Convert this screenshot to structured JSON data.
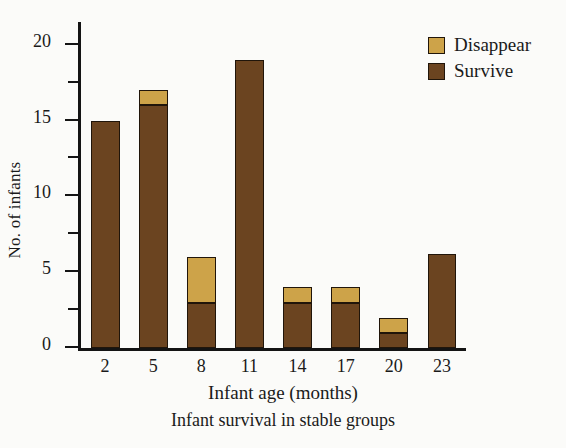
{
  "chart_data": {
    "type": "bar",
    "title": "",
    "caption": "Infant survival in stable groups",
    "xlabel": "Infant age (months)",
    "ylabel": "No. of infants",
    "categories": [
      "2",
      "5",
      "8",
      "11",
      "14",
      "17",
      "20",
      "23"
    ],
    "stacked": true,
    "series": [
      {
        "name": "Survive",
        "color": "#6b4420",
        "values": [
          15,
          16,
          3,
          19,
          3,
          3,
          1,
          6.2
        ]
      },
      {
        "name": "Disappear",
        "color": "#cda349",
        "values": [
          0,
          1,
          3,
          0,
          1,
          1,
          1,
          0
        ]
      }
    ],
    "totals": [
      15,
      17,
      6,
      19,
      4,
      4,
      2,
      6.2
    ],
    "ylim": [
      0,
      21.5
    ],
    "ytick_major": [
      0,
      5,
      10,
      15,
      20
    ],
    "ytick_minor": [
      2.5,
      7.5,
      12.5,
      17.5
    ],
    "ytick_labels": [
      "0",
      "5",
      "10",
      "15",
      "20"
    ],
    "grid": false,
    "legend_position": "top-right",
    "legend": [
      "Disappear",
      "Survive"
    ]
  },
  "legend": {
    "items": [
      {
        "label": "Disappear",
        "color": "#cda349"
      },
      {
        "label": "Survive",
        "color": "#6b4420"
      }
    ]
  }
}
